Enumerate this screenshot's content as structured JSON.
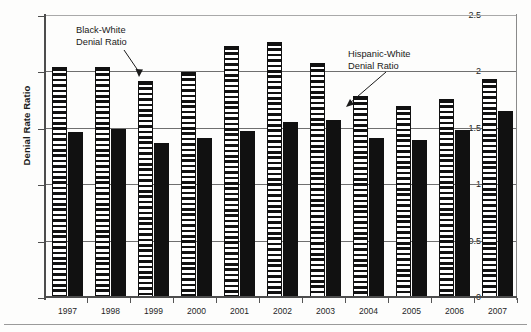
{
  "chart_data": {
    "type": "bar",
    "title": "",
    "subtitle": "",
    "xlabel": "",
    "ylabel": "Denial Rate Ratio",
    "categories": [
      "1997",
      "1998",
      "1999",
      "2000",
      "2001",
      "2002",
      "2003",
      "2004",
      "2005",
      "2006",
      "2007"
    ],
    "ylim": [
      0,
      2.5
    ],
    "yticks": [
      "0",
      "0.5",
      "1",
      "1.5",
      "2",
      "2.5"
    ],
    "ytick_values": [
      0,
      0.5,
      1,
      1.5,
      2,
      2.5
    ],
    "grid": true,
    "legend_position": "annotations",
    "series": [
      {
        "name": "Black-White Denial Ratio",
        "style": "horizontal-striped",
        "color": "#111111",
        "values": [
          2.05,
          2.05,
          1.92,
          2.0,
          2.23,
          2.27,
          2.08,
          1.79,
          1.7,
          1.76,
          1.94
        ]
      },
      {
        "name": "Hispanic-White Denial Ratio",
        "style": "solid-black",
        "color": "#111111",
        "values": [
          1.47,
          1.5,
          1.37,
          1.42,
          1.48,
          1.56,
          1.58,
          1.42,
          1.4,
          1.49,
          1.66
        ]
      }
    ],
    "annotations": [
      {
        "text_line1": "Black-White",
        "text_line2": "Denial Ratio",
        "points_to": "1999 striped bar"
      },
      {
        "text_line1": "Hispanic-White",
        "text_line2": "Denial Ratio",
        "points_to": "2004 solid bar"
      }
    ]
  }
}
